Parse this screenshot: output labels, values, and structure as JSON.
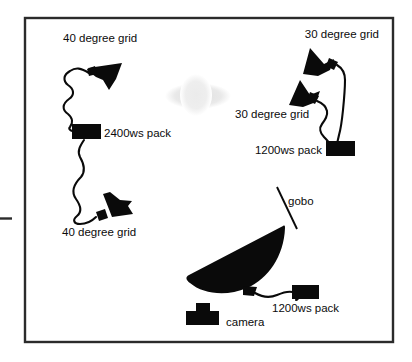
{
  "diagram": {
    "background_color": "#ffffff",
    "ink_color": "#0a0a0a",
    "frame_color": "#2b2b2b",
    "subject_color": "#e8e8e8",
    "frame": {
      "x": 25,
      "y": 18,
      "width": 368,
      "height": 324
    },
    "labels": {
      "grid_40_top": "40 degree grid",
      "grid_40_bottom": "40 degree grid",
      "grid_30_top": "30 degree grid",
      "grid_30_lower": "30 degree grid",
      "pack_2400": "2400ws pack",
      "pack_1200_right": "1200ws pack",
      "pack_1200_bottom": "1200ws pack",
      "gobo": "gobo",
      "camera": "camera"
    },
    "elements": {
      "light_top_left": "40 degree grid light head",
      "light_bottom_left": "40 degree grid light head",
      "light_top_right": "30 degree grid light head",
      "light_mid_right": "30 degree grid light head",
      "softbox": "large reflector / umbrella with gobo",
      "subject": "subject silhouette",
      "camera_icon": "camera"
    }
  }
}
